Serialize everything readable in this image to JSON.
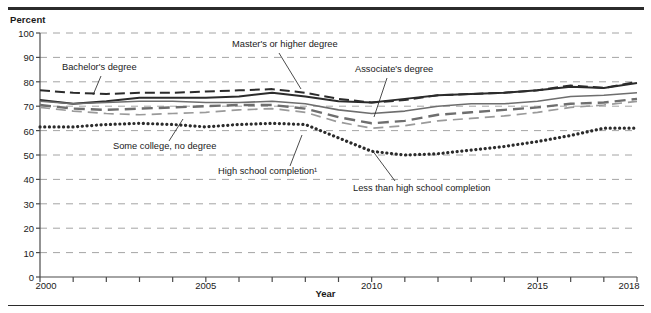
{
  "axis_unit_label": "Percent",
  "xaxis_title": "Year",
  "annotations": {
    "bachelors": "Bachelor's degree",
    "masters": "Master's or higher degree",
    "associates": "Associate's degree",
    "some_college": "Some college, no degree",
    "high_school": "High school completion¹",
    "less_than_hs": "Less than high school completion"
  },
  "colors": {
    "dark": "#2b2b2b",
    "mid": "#6e6e6e",
    "light": "#9a9a9a",
    "grid": "#9a9a9a",
    "axis": "#4a4a4a"
  },
  "chart_data": {
    "type": "line",
    "title": "",
    "xlabel": "Year",
    "ylabel": "Percent",
    "xlim": [
      2000,
      2018
    ],
    "ylim": [
      0,
      100
    ],
    "grid": true,
    "legend": "inline-annotations",
    "x": [
      2000,
      2001,
      2002,
      2003,
      2004,
      2005,
      2006,
      2007,
      2008,
      2009,
      2010,
      2011,
      2012,
      2013,
      2014,
      2015,
      2016,
      2017,
      2018
    ],
    "yticks": [
      0,
      10,
      20,
      30,
      40,
      50,
      60,
      70,
      80,
      90,
      100
    ],
    "xticks": [
      2000,
      2005,
      2010,
      2015,
      2018
    ],
    "xtick_labels": [
      "2000",
      "2005",
      "2010",
      "2015",
      "2018"
    ],
    "series": [
      {
        "name": "Master's or higher degree",
        "style": "solid-dark",
        "values": [
          72.5,
          71.0,
          72.0,
          73.5,
          73.5,
          73.5,
          74.0,
          75.5,
          74.0,
          72.0,
          71.5,
          73.0,
          74.5,
          75.0,
          75.5,
          76.5,
          78.0,
          77.5,
          79.5
        ]
      },
      {
        "name": "Bachelor's degree",
        "style": "dashed-dark",
        "values": [
          76.5,
          75.5,
          75.0,
          75.5,
          75.5,
          76.0,
          76.5,
          77.0,
          75.5,
          73.0,
          71.5,
          72.5,
          74.5,
          75.0,
          75.5,
          76.5,
          78.5,
          77.5,
          80.0
        ]
      },
      {
        "name": "Associate's degree",
        "style": "solid-mid",
        "values": [
          72.0,
          71.0,
          71.5,
          72.0,
          72.0,
          71.5,
          71.5,
          72.0,
          71.0,
          68.5,
          67.0,
          68.0,
          70.0,
          71.0,
          71.0,
          72.0,
          74.0,
          74.5,
          75.5
        ]
      },
      {
        "name": "Some college, no degree",
        "style": "dashed-mid",
        "values": [
          70.5,
          69.0,
          68.5,
          69.0,
          69.5,
          70.0,
          70.5,
          70.5,
          69.0,
          65.5,
          63.0,
          64.0,
          66.5,
          67.5,
          68.5,
          69.5,
          71.0,
          71.5,
          73.0
        ]
      },
      {
        "name": "High school completion",
        "style": "dashed-light",
        "values": [
          69.5,
          68.0,
          67.0,
          66.5,
          67.0,
          67.5,
          68.5,
          69.0,
          67.5,
          63.5,
          61.0,
          62.0,
          64.0,
          65.0,
          66.0,
          67.5,
          69.5,
          70.5,
          72.0
        ]
      },
      {
        "name": "Less than high school completion",
        "style": "dotted-dark",
        "values": [
          61.5,
          61.5,
          62.5,
          63.0,
          62.5,
          61.5,
          62.5,
          63.0,
          62.5,
          57.0,
          51.5,
          50.0,
          50.5,
          52.0,
          53.5,
          55.5,
          58.0,
          61.0,
          61.0
        ]
      }
    ]
  }
}
